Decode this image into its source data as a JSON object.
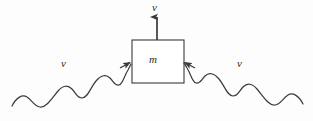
{
  "figure": {
    "name": "photon-absorption-recoil-diagram",
    "background_color": "#fdfdfd",
    "stroke_color": "#3a3a3a",
    "label_color": "#2b2b2b"
  },
  "mass_box": {
    "label": "m",
    "shape": "square",
    "x": 132,
    "y": 40,
    "width": 52,
    "height": 43,
    "border_color": "#3a3a3a",
    "fill_color": "#ffffff"
  },
  "velocity_arrow": {
    "label": "v",
    "direction": "up",
    "tail_x": 157,
    "tail_y": 40,
    "tip_x": 157,
    "tip_y": 15
  },
  "photons": [
    {
      "label": "ν",
      "side": "left",
      "direction": "incoming-right",
      "arrow_tip_x": 131,
      "arrow_tip_y": 62,
      "wave_start_x": 12,
      "wave_start_y": 106
    },
    {
      "label": "ν",
      "side": "right",
      "direction": "incoming-left",
      "arrow_tip_x": 185,
      "arrow_tip_y": 62,
      "wave_start_x": 303,
      "wave_start_y": 104
    }
  ]
}
